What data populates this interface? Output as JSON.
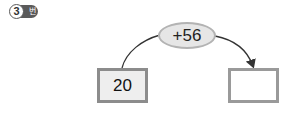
{
  "problem": {
    "number": "3",
    "suffix": "번"
  },
  "diagram": {
    "operation": "+56",
    "start_value": "20",
    "result_value": ""
  }
}
